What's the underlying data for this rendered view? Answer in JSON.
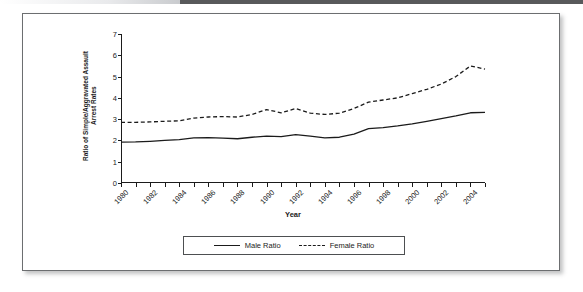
{
  "figure": {
    "x_axis_title": "Year",
    "y_axis_title": "Ratio of Simple/Aggravated Assault\nArrest Rates",
    "legend": {
      "male_label": "Male Ratio",
      "female_label": "Female Ratio"
    },
    "line_color": "#1b1b1b",
    "panel_border_color": "#6c6e70"
  },
  "chart_data": {
    "type": "line",
    "title": "",
    "subtitle": "",
    "xlabel": "Year",
    "ylabel": "Ratio of Simple/Aggravated Assault Arrest Rates",
    "xlim": [
      1980,
      2005
    ],
    "ylim": [
      0,
      7
    ],
    "yticks": [
      0,
      1,
      2,
      3,
      4,
      5,
      6,
      7
    ],
    "grid": false,
    "legend_position": "bottom-center",
    "x": [
      1980,
      1981,
      1982,
      1983,
      1984,
      1985,
      1986,
      1987,
      1988,
      1989,
      1990,
      1991,
      1992,
      1993,
      1994,
      1995,
      1996,
      1997,
      1998,
      1999,
      2000,
      2001,
      2002,
      2003,
      2004,
      2005
    ],
    "x_tick_labels": [
      "1980",
      "",
      "1982",
      "",
      "1984",
      "",
      "1986",
      "",
      "1988",
      "",
      "1990",
      "",
      "1992",
      "",
      "1994",
      "",
      "1996",
      "",
      "1998",
      "",
      "2000",
      "",
      "2002",
      "",
      "2004",
      ""
    ],
    "series": [
      {
        "name": "Male Ratio",
        "style": "solid",
        "values": [
          1.92,
          1.93,
          1.96,
          2.0,
          2.04,
          2.12,
          2.13,
          2.11,
          2.08,
          2.15,
          2.2,
          2.18,
          2.27,
          2.2,
          2.12,
          2.15,
          2.3,
          2.55,
          2.6,
          2.68,
          2.78,
          2.9,
          3.02,
          3.15,
          3.3,
          3.32
        ]
      },
      {
        "name": "Female Ratio",
        "style": "dashed",
        "values": [
          2.85,
          2.85,
          2.87,
          2.9,
          2.92,
          3.05,
          3.1,
          3.12,
          3.1,
          3.22,
          3.45,
          3.3,
          3.5,
          3.28,
          3.22,
          3.28,
          3.5,
          3.8,
          3.9,
          4.0,
          4.2,
          4.4,
          4.65,
          5.0,
          5.5,
          5.35
        ]
      }
    ]
  }
}
